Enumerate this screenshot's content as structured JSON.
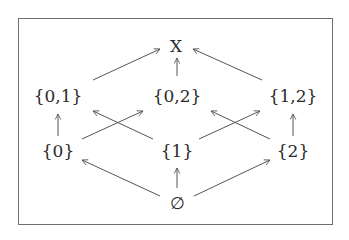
{
  "diagram": {
    "nodes": [
      {
        "id": "X",
        "label": "X",
        "x": 176,
        "y": 46
      },
      {
        "id": "01",
        "label": "{0,1}",
        "x": 58,
        "y": 96
      },
      {
        "id": "02",
        "label": "{0,2}",
        "x": 177,
        "y": 96
      },
      {
        "id": "12",
        "label": "{1,2}",
        "x": 293,
        "y": 96
      },
      {
        "id": "0",
        "label": "{0}",
        "x": 58,
        "y": 151
      },
      {
        "id": "1",
        "label": "{1}",
        "x": 177,
        "y": 151
      },
      {
        "id": "2",
        "label": "{2}",
        "x": 293,
        "y": 151
      },
      {
        "id": "e",
        "label": "∅",
        "x": 177,
        "y": 203
      }
    ],
    "edges": [
      {
        "from": "01",
        "to": "X",
        "x1": 93,
        "y1": 80,
        "x2": 160,
        "y2": 49
      },
      {
        "from": "02",
        "to": "X",
        "x1": 177,
        "y1": 76,
        "x2": 177,
        "y2": 58
      },
      {
        "from": "12",
        "to": "X",
        "x1": 262,
        "y1": 80,
        "x2": 193,
        "y2": 49
      },
      {
        "from": "0",
        "to": "01",
        "x1": 58,
        "y1": 136,
        "x2": 58,
        "y2": 114
      },
      {
        "from": "2",
        "to": "12",
        "x1": 293,
        "y1": 136,
        "x2": 293,
        "y2": 114
      },
      {
        "from": "0",
        "to": "02",
        "x1": 82,
        "y1": 139,
        "x2": 143,
        "y2": 111
      },
      {
        "from": "1",
        "to": "01",
        "x1": 153,
        "y1": 139,
        "x2": 93,
        "y2": 111
      },
      {
        "from": "1",
        "to": "12",
        "x1": 199,
        "y1": 139,
        "x2": 260,
        "y2": 111
      },
      {
        "from": "2",
        "to": "02",
        "x1": 270,
        "y1": 139,
        "x2": 211,
        "y2": 111
      },
      {
        "from": "e",
        "to": "0",
        "x1": 160,
        "y1": 196,
        "x2": 82,
        "y2": 160
      },
      {
        "from": "e",
        "to": "1",
        "x1": 177,
        "y1": 188,
        "x2": 177,
        "y2": 168
      },
      {
        "from": "e",
        "to": "2",
        "x1": 194,
        "y1": 196,
        "x2": 270,
        "y2": 160
      }
    ],
    "colors": {
      "stroke": "#555555",
      "text": "#2a2a2a",
      "frame": "#6e6e6e"
    }
  }
}
